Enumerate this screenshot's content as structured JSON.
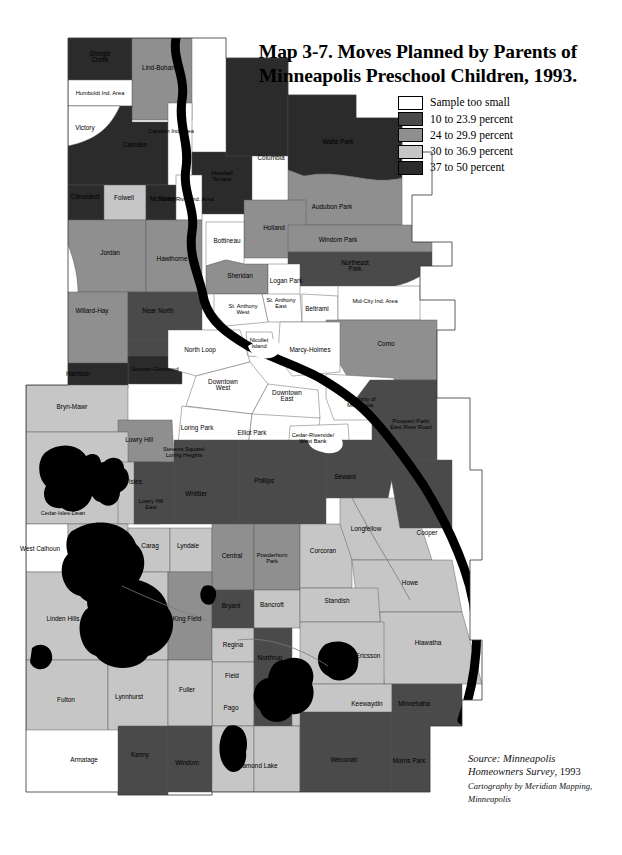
{
  "title": {
    "line1": "Map 3-7. Moves Planned by Parents of",
    "line2": "Minneapolis Preschool Children, 1993."
  },
  "legend": {
    "items": [
      {
        "label": "Sample too small",
        "color": "#ffffff",
        "key": "none"
      },
      {
        "label": "10 to 23.9 percent",
        "color": "#4a4a4a",
        "key": "c1"
      },
      {
        "label": "24 to 29.9 percent",
        "color": "#8f8f8f",
        "key": "c2"
      },
      {
        "label": "30 to 36.9 percent",
        "color": "#c6c6c6",
        "key": "c3"
      },
      {
        "label": "37 to 50 percent",
        "color": "#2b2b2b",
        "key": "c4"
      }
    ]
  },
  "source": {
    "line1": "Source: Minneapolis",
    "line2_italic": "Homeowners Survey",
    "line2_rest": ", 1993",
    "credit1": "Cartography by Meridian Mapping,",
    "credit2": "Minneapolis"
  },
  "map": {
    "river_color": "#000000",
    "lake_color": "#000000",
    "border_color": "#555555",
    "neighborhoods": [
      {
        "name": "Shingle Creek",
        "class": "c4",
        "lx": 100,
        "ly": 57
      },
      {
        "name": "Lind-Bohanon",
        "class": "c2",
        "lx": 162,
        "ly": 68
      },
      {
        "name": "Humboldt Ind. Area",
        "class": "none",
        "lx": 100,
        "ly": 93
      },
      {
        "name": "Victory",
        "class": "c4",
        "lx": 85,
        "ly": 128
      },
      {
        "name": "Camden",
        "class": "c4",
        "lx": 135,
        "ly": 145
      },
      {
        "name": "Camden Ind. Area",
        "class": "none",
        "lx": 171,
        "ly": 131
      },
      {
        "name": "Marshall Terrace",
        "class": "c4",
        "lx": 222,
        "ly": 176
      },
      {
        "name": "Cleveland",
        "class": "c4",
        "lx": 85,
        "ly": 197
      },
      {
        "name": "Folwell",
        "class": "c3",
        "lx": 124,
        "ly": 198
      },
      {
        "name": "McKinley",
        "class": "c4",
        "lx": 163,
        "ly": 199
      },
      {
        "name": "North River Ind. Area",
        "class": "none",
        "lx": 187,
        "ly": 199
      },
      {
        "name": "Jordan",
        "class": "c2",
        "lx": 110,
        "ly": 253
      },
      {
        "name": "Hawthorne",
        "class": "c2",
        "lx": 172,
        "ly": 259
      },
      {
        "name": "Bottineau",
        "class": "none",
        "lx": 227,
        "ly": 241
      },
      {
        "name": "Columbia",
        "class": "c4",
        "lx": 271,
        "ly": 158
      },
      {
        "name": "Waite Park",
        "class": "c4",
        "lx": 338,
        "ly": 142
      },
      {
        "name": "Audubon Park",
        "class": "c2",
        "lx": 332,
        "ly": 207
      },
      {
        "name": "Holland",
        "class": "c2",
        "lx": 274,
        "ly": 228
      },
      {
        "name": "Windom Park",
        "class": "c2",
        "lx": 338,
        "ly": 240
      },
      {
        "name": "Northeast Park",
        "class": "c1",
        "lx": 355,
        "ly": 266
      },
      {
        "name": "Sheridan",
        "class": "c2",
        "lx": 240,
        "ly": 276
      },
      {
        "name": "Logan Park",
        "class": "none",
        "lx": 286,
        "ly": 281
      },
      {
        "name": "Willard-Hay",
        "class": "c2",
        "lx": 92,
        "ly": 311
      },
      {
        "name": "Near North",
        "class": "c1",
        "lx": 158,
        "ly": 311
      },
      {
        "name": "St. Anthony West",
        "class": "none",
        "lx": 243,
        "ly": 309
      },
      {
        "name": "St. Anthony East",
        "class": "none",
        "lx": 281,
        "ly": 303
      },
      {
        "name": "Beltrami",
        "class": "none",
        "lx": 317,
        "ly": 309
      },
      {
        "name": "Mid-City Ind. Area",
        "class": "none",
        "lx": 375,
        "ly": 301
      },
      {
        "name": "Marcy-Holmes",
        "class": "none",
        "lx": 310,
        "ly": 350
      },
      {
        "name": "Como",
        "class": "c2",
        "lx": 386,
        "ly": 344
      },
      {
        "name": "North Loop",
        "class": "none",
        "lx": 200,
        "ly": 350
      },
      {
        "name": "Nicollet Island",
        "class": "none",
        "lx": 259,
        "ly": 343
      },
      {
        "name": "Sumner-Glenwood",
        "class": "c4",
        "lx": 155,
        "ly": 369
      },
      {
        "name": "Harrison",
        "class": "c4",
        "lx": 78,
        "ly": 374
      },
      {
        "name": "Downtown West",
        "class": "none",
        "lx": 223,
        "ly": 385
      },
      {
        "name": "Downtown East",
        "class": "none",
        "lx": 287,
        "ly": 396
      },
      {
        "name": "University of Minnesota",
        "class": "none",
        "lx": 360,
        "ly": 402
      },
      {
        "name": "Prospect Park/ East River Road",
        "class": "c1",
        "lx": 411,
        "ly": 424
      },
      {
        "name": "Bryn-Mawr",
        "class": "c3",
        "lx": 72,
        "ly": 407
      },
      {
        "name": "Lowry Hill",
        "class": "c2",
        "lx": 139,
        "ly": 440
      },
      {
        "name": "Loring Park",
        "class": "none",
        "lx": 197,
        "ly": 428
      },
      {
        "name": "Elliot Park",
        "class": "none",
        "lx": 252,
        "ly": 433
      },
      {
        "name": "Cedar-Riverside/ West Bank",
        "class": "none",
        "lx": 313,
        "ly": 438
      },
      {
        "name": "Stevens Square/ Loring Heights",
        "class": "none",
        "lx": 184,
        "ly": 452
      },
      {
        "name": "Kenwood",
        "class": "c3",
        "lx": 91,
        "ly": 470
      },
      {
        "name": "East Isles",
        "class": "c3",
        "lx": 128,
        "ly": 482
      },
      {
        "name": "Lowry Hill East",
        "class": "c1",
        "lx": 151,
        "ly": 504
      },
      {
        "name": "Whittier",
        "class": "c1",
        "lx": 196,
        "ly": 494
      },
      {
        "name": "Phillips",
        "class": "c1",
        "lx": 264,
        "ly": 481
      },
      {
        "name": "Seward",
        "class": "c1",
        "lx": 345,
        "ly": 477
      },
      {
        "name": "Cedar-Isles-Dean",
        "class": "c3",
        "lx": 63,
        "ly": 513
      },
      {
        "name": "Longfellow",
        "class": "c3",
        "lx": 366,
        "ly": 529
      },
      {
        "name": "Cooper",
        "class": "c1",
        "lx": 427,
        "ly": 533
      },
      {
        "name": "West Calhoun",
        "class": "none",
        "lx": 40,
        "ly": 549
      },
      {
        "name": "ECCO",
        "class": "c3",
        "lx": 101,
        "ly": 534
      },
      {
        "name": "Carag",
        "class": "c3",
        "lx": 150,
        "ly": 546
      },
      {
        "name": "Lyndale",
        "class": "c3",
        "lx": 188,
        "ly": 546
      },
      {
        "name": "Central",
        "class": "c1",
        "lx": 232,
        "ly": 556
      },
      {
        "name": "Powderhorn Park",
        "class": "c1",
        "lx": 272,
        "ly": 558
      },
      {
        "name": "Corcoran",
        "class": "c2",
        "lx": 323,
        "ly": 551
      },
      {
        "name": "Howe",
        "class": "c3",
        "lx": 410,
        "ly": 583
      },
      {
        "name": "Linden Hills",
        "class": "c3",
        "lx": 63,
        "ly": 619
      },
      {
        "name": "East Harriet",
        "class": "c3",
        "lx": 124,
        "ly": 606
      },
      {
        "name": "King Field",
        "class": "c2",
        "lx": 187,
        "ly": 619
      },
      {
        "name": "Bryant",
        "class": "c1",
        "lx": 231,
        "ly": 606
      },
      {
        "name": "Bancroft",
        "class": "c3",
        "lx": 272,
        "ly": 605
      },
      {
        "name": "Standish",
        "class": "c3",
        "lx": 337,
        "ly": 601
      },
      {
        "name": "Regina",
        "class": "c3",
        "lx": 233,
        "ly": 645
      },
      {
        "name": "Hiawatha",
        "class": "c3",
        "lx": 428,
        "ly": 643
      },
      {
        "name": "Field",
        "class": "c3",
        "lx": 232,
        "ly": 676
      },
      {
        "name": "Northrup",
        "class": "c1",
        "lx": 270,
        "ly": 658
      },
      {
        "name": "Ericsson",
        "class": "c3",
        "lx": 368,
        "ly": 656
      },
      {
        "name": "Fulton",
        "class": "c3",
        "lx": 66,
        "ly": 700
      },
      {
        "name": "Lynnhurst",
        "class": "c3",
        "lx": 129,
        "ly": 697
      },
      {
        "name": "Fuller",
        "class": "c3",
        "lx": 187,
        "ly": 690
      },
      {
        "name": "Pago",
        "class": "c3",
        "lx": 231,
        "ly": 708
      },
      {
        "name": "Hale",
        "class": "c1",
        "lx": 271,
        "ly": 710
      },
      {
        "name": "Keewaydin",
        "class": "c3",
        "lx": 367,
        "ly": 704
      },
      {
        "name": "Minnehaha",
        "class": "c1",
        "lx": 414,
        "ly": 704
      },
      {
        "name": "Armatage",
        "class": "c1",
        "lx": 84,
        "ly": 760
      },
      {
        "name": "Kenny",
        "class": "c1",
        "lx": 140,
        "ly": 755
      },
      {
        "name": "Windom",
        "class": "c3",
        "lx": 187,
        "ly": 763
      },
      {
        "name": "Diamond Lake",
        "class": "c3",
        "lx": 257,
        "ly": 766
      },
      {
        "name": "Wenonah",
        "class": "c1",
        "lx": 344,
        "ly": 760
      },
      {
        "name": "Morris Park",
        "class": "c1",
        "lx": 409,
        "ly": 761
      }
    ]
  }
}
